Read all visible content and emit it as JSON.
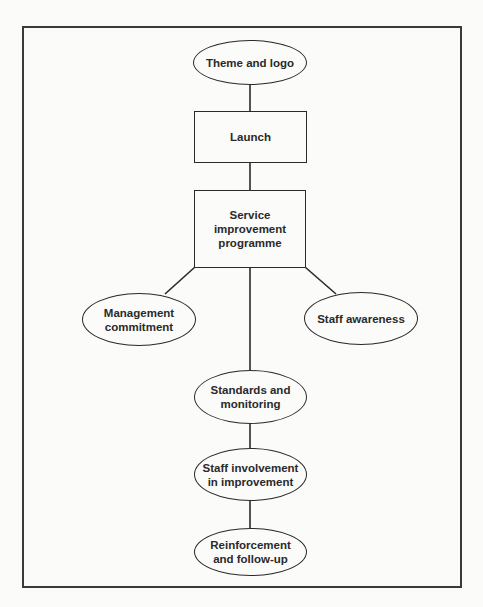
{
  "diagram": {
    "type": "flowchart",
    "nodes": [
      {
        "id": "theme",
        "shape": "ellipse",
        "label": "Theme and logo"
      },
      {
        "id": "launch",
        "shape": "rect",
        "label": "Launch"
      },
      {
        "id": "sip",
        "shape": "rect",
        "label": "Service\nimprovement\nprogramme"
      },
      {
        "id": "mgmt",
        "shape": "ellipse",
        "label": "Management\ncommitment"
      },
      {
        "id": "awareness",
        "shape": "ellipse",
        "label": "Staff awareness"
      },
      {
        "id": "standards",
        "shape": "ellipse",
        "label": "Standards and\nmonitoring"
      },
      {
        "id": "involvement",
        "shape": "ellipse",
        "label": "Staff involvement\nin improvement"
      },
      {
        "id": "reinforcement",
        "shape": "ellipse",
        "label": "Reinforcement\nand follow-up"
      }
    ],
    "edges": [
      {
        "from": "theme",
        "to": "launch"
      },
      {
        "from": "launch",
        "to": "sip"
      },
      {
        "from": "sip",
        "to": "mgmt"
      },
      {
        "from": "sip",
        "to": "awareness"
      },
      {
        "from": "sip",
        "to": "standards"
      },
      {
        "from": "standards",
        "to": "involvement"
      },
      {
        "from": "involvement",
        "to": "reinforcement"
      }
    ],
    "colors": {
      "line": "#2a2a2a",
      "frame": "#3a3a3a",
      "background": "#fbfbfa"
    }
  }
}
